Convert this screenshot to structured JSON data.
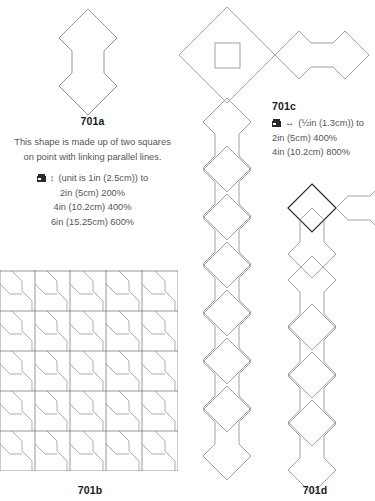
{
  "page": {
    "background": "#ffffff",
    "line_color": "#6e6e6e",
    "grid_color": "#6b6b6b",
    "text_color": "#555555",
    "heading_color": "#1a1a1a"
  },
  "figures": {
    "a": {
      "label": "701a",
      "description_lines": [
        "This shape is made up of two squares",
        "on point with linking parallel lines."
      ],
      "icon": "photocopier-icon",
      "measure_glyph": "↕",
      "scale_lines": [
        "(unit is 1in (2.5cm)) to",
        "2in (5cm) 200%",
        "4in (10.2cm) 400%",
        "6in (15.25cm) 600%"
      ]
    },
    "b": {
      "label": "701b"
    },
    "c": {
      "label": "701c",
      "icon": "photocopier-icon",
      "measure_glyph": "↔",
      "scale_lines": [
        "(½in (1.3cm)) to",
        "2in (5cm) 400%",
        "4in (10.2cm) 800%"
      ]
    },
    "d": {
      "label": "701d"
    }
  }
}
